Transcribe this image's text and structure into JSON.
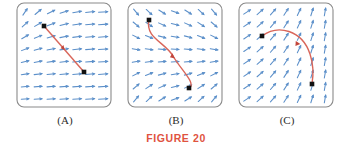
{
  "figure": {
    "caption": "FIGURE 20",
    "caption_color": "#e0533f",
    "background": "#ffffff",
    "frame_color": "#8a8a8a",
    "vector_color": "#5b8fc9",
    "path_color": "#d9665a",
    "point_color": "#111111"
  },
  "panels": [
    {
      "id": "panel-a",
      "label": "(A)",
      "description": "Vector field with nearly horizontal arrows at right, steep up-right arrows at upper left; a straight red path descends from upper-left point to lower-right point.",
      "field_type": "shear-horizontal",
      "path": {
        "shape": "straight",
        "start": [
          30,
          26
        ],
        "end": [
          70,
          72
        ],
        "direction": "start-to-end",
        "arrowhead_t": 0.5
      },
      "points": [
        {
          "name": "start-point",
          "x": 30,
          "y": 26
        },
        {
          "name": "end-point",
          "x": 70,
          "y": 72
        }
      ]
    },
    {
      "id": "panel-b",
      "label": "(B)",
      "description": "Funnel shaped field converging toward a horizontal center line; red S-shaped path from upper-left point curving down and right to lower point.",
      "field_type": "converging-funnel",
      "path": {
        "shape": "s-curve",
        "start": [
          24,
          20
        ],
        "end": [
          64,
          88
        ],
        "direction": "start-to-end",
        "arrowhead_t": 0.5
      },
      "points": [
        {
          "name": "start-point",
          "x": 24,
          "y": 20
        },
        {
          "name": "end-point",
          "x": 64,
          "y": 88
        }
      ]
    },
    {
      "id": "panel-c",
      "label": "(C)",
      "description": "Diagonal field becoming steeper toward the right; red arc from left point curving up and over then down to lower-right point.",
      "field_type": "diagonal-steepening",
      "path": {
        "shape": "arc",
        "start": [
          26,
          36
        ],
        "end": [
          76,
          84
        ],
        "direction": "start-to-end",
        "arrowhead_t": 0.48
      },
      "points": [
        {
          "name": "start-point",
          "x": 26,
          "y": 36
        },
        {
          "name": "end-point",
          "x": 76,
          "y": 84
        }
      ]
    }
  ],
  "chart_data": {
    "type": "scatter",
    "title": "FIGURE 20",
    "xlabel": "",
    "ylabel": "",
    "panels": [
      "(A)",
      "(B)",
      "(C)"
    ],
    "series": [
      {
        "name": "vector-field-a",
        "values": []
      },
      {
        "name": "path-a",
        "values": []
      },
      {
        "name": "vector-field-b",
        "values": []
      },
      {
        "name": "path-b",
        "values": []
      },
      {
        "name": "vector-field-c",
        "values": []
      },
      {
        "name": "path-c",
        "values": []
      }
    ]
  }
}
